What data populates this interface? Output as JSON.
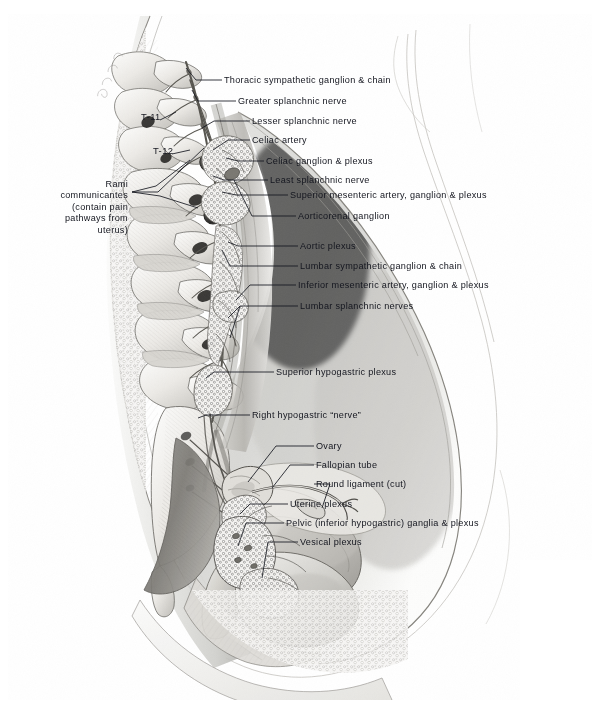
{
  "plate": {
    "title": "Autonomic innervation of the female pelvis — midsagittal section",
    "medium": "graphite / carbon pencil anatomical illustration",
    "signature": "artist signature (illegible)",
    "background_color": "#ffffff",
    "ink_color": "#14161f"
  },
  "vertebra_markers": [
    {
      "id": "t11",
      "label": "T-11",
      "x": 143,
      "y": 118
    },
    {
      "id": "t12",
      "label": "T-12",
      "x": 155,
      "y": 152
    }
  ],
  "left_labels": [
    {
      "id": "rami-communicantes",
      "lines": [
        "Rami",
        "communicantes",
        "(contain pain",
        "pathways from",
        "uterus)"
      ],
      "x": 70,
      "y": 184
    }
  ],
  "right_labels": [
    {
      "id": "thoracic-sympathetic-ganglion-chain",
      "text": "Thoracic sympathetic ganglion & chain",
      "x": 224,
      "y": 83
    },
    {
      "id": "greater-splanchnic-nerve",
      "text": "Greater splanchnic nerve",
      "x": 238,
      "y": 104
    },
    {
      "id": "lesser-splanchnic-nerve",
      "text": "Lesser splanchnic nerve",
      "x": 252,
      "y": 124
    },
    {
      "id": "celiac-artery",
      "text": "Celiac artery",
      "x": 252,
      "y": 143
    },
    {
      "id": "celiac-ganglion-plexus",
      "text": "Celiac ganglion & plexus",
      "x": 266,
      "y": 164
    },
    {
      "id": "least-splanchnic-nerve",
      "text": "Least splanchnic nerve",
      "x": 270,
      "y": 183
    },
    {
      "id": "superior-mesenteric-artery-ganglion-plexus",
      "text": "Superior mesenteric artery, ganglion & plexus",
      "x": 290,
      "y": 198
    },
    {
      "id": "aorticorenal-ganglion",
      "text": "Aorticorenal ganglion",
      "x": 298,
      "y": 219
    },
    {
      "id": "aortic-plexus",
      "text": "Aortic plexus",
      "x": 300,
      "y": 249
    },
    {
      "id": "lumbar-sympathetic-ganglion-chain",
      "text": "Lumbar sympathetic ganglion & chain",
      "x": 300,
      "y": 269
    },
    {
      "id": "inferior-mesenteric-artery-ganglion-plexus",
      "text": "Inferior mesenteric artery, ganglion & plexus",
      "x": 298,
      "y": 288
    },
    {
      "id": "lumbar-splanchnic-nerves",
      "text": "Lumbar splanchnic nerves",
      "x": 300,
      "y": 309
    },
    {
      "id": "superior-hypogastric-plexus",
      "text": "Superior hypogastric plexus",
      "x": 276,
      "y": 375
    },
    {
      "id": "right-hypogastric-nerve",
      "text": "Right hypogastric “nerve”",
      "x": 252,
      "y": 418
    },
    {
      "id": "ovary",
      "text": "Ovary",
      "x": 316,
      "y": 449
    },
    {
      "id": "fallopian-tube",
      "text": "Fallopian tube",
      "x": 316,
      "y": 468
    },
    {
      "id": "round-ligament-cut",
      "text": "Round ligament (cut)",
      "x": 316,
      "y": 487
    },
    {
      "id": "uterine-plexus",
      "text": "Uterine plexus",
      "x": 290,
      "y": 507
    },
    {
      "id": "pelvic-inferior-hypogastric-ganglia-plexus",
      "text": "Pelvic (inferior hypogastric) ganglia & plexus",
      "x": 286,
      "y": 526
    },
    {
      "id": "vesical-plexus",
      "text": "Vesical plexus",
      "x": 300,
      "y": 545
    }
  ]
}
